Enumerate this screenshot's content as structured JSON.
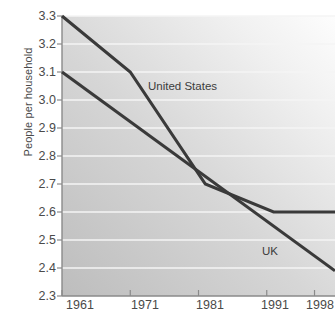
{
  "chart_data": {
    "type": "line",
    "title": "",
    "xlabel": "",
    "ylabel": "People per household",
    "xlim": [
      1961,
      2001
    ],
    "ylim": [
      2.3,
      3.3
    ],
    "grid": true,
    "legend_position": "inline-annotations",
    "x_tick_labels": [
      "1961",
      "1971",
      "1981",
      "1991",
      "1998"
    ],
    "x_tick_values": [
      1961,
      1971,
      1981,
      1991,
      1998
    ],
    "y_tick_labels": [
      "3.3",
      "3.2",
      "3.1",
      "3.0",
      "2.9",
      "2.8",
      "2.7",
      "2.6",
      "2.5",
      "2.4",
      "2.3"
    ],
    "y_tick_values": [
      3.3,
      3.2,
      3.1,
      3.0,
      2.9,
      2.8,
      2.7,
      2.6,
      2.5,
      2.4,
      2.3
    ],
    "series": [
      {
        "name": "United States",
        "color": "#3a3a3a",
        "x": [
          1961,
          1971,
          1982,
          1992,
          2001
        ],
        "values": [
          3.3,
          3.1,
          2.7,
          2.6,
          2.6
        ]
      },
      {
        "name": "UK",
        "color": "#3a3a3a",
        "x": [
          1961,
          2001
        ],
        "values": [
          3.1,
          2.39
        ]
      }
    ],
    "annotations": [
      {
        "text": "United States",
        "x": 1973.5,
        "y": 3.02
      },
      {
        "text": "UK",
        "x": 1994.5,
        "y": 2.47
      }
    ]
  },
  "axes": {
    "y_title": "People per household"
  },
  "colors": {
    "line": "#3a3a3a",
    "axis": "#8a8a8a",
    "grid": "#f2f2f2",
    "text": "#4a4a4a",
    "plot_bg_dark": "#c0c0c0",
    "plot_bg_light": "#fbfbfb"
  }
}
